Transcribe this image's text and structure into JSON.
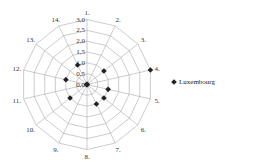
{
  "chart_data": {
    "type": "radar",
    "title": "",
    "categories": [
      "1.",
      "2.",
      "3.",
      "4.",
      "5.",
      "6.",
      "7.",
      "8.",
      "9.",
      "10.",
      "11.",
      "12.",
      "13.",
      "14."
    ],
    "series": [
      {
        "name": "Luxembourg",
        "values": [
          0,
          0,
          1,
          3,
          1,
          1,
          1,
          0,
          0,
          1,
          0,
          1,
          0,
          1
        ],
        "color": "#222222"
      }
    ],
    "radial_ticks": [
      "0,0",
      "0,5",
      "1,0",
      "1,5",
      "2,0",
      "2,5",
      "3,0"
    ],
    "rlim": [
      0,
      3
    ],
    "grid": true,
    "legend_position": "right"
  },
  "legend": {
    "label": "Luxembourg"
  }
}
